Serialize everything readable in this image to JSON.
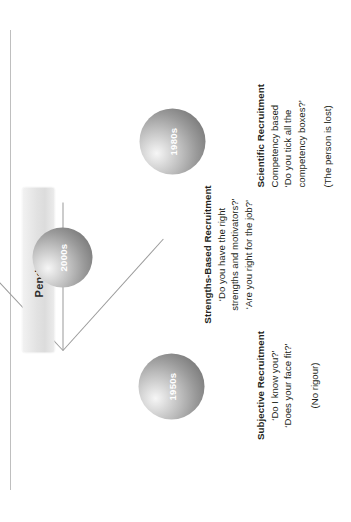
{
  "diagram": {
    "title": "Pendulum",
    "pivot_label": "Pendulum",
    "nodes": [
      {
        "era": "1950s",
        "heading": "Subjective Recruitment",
        "lines": [
          "‘Do I know you?’",
          "‘Does your face fit?’"
        ],
        "note": "(No rigour)"
      },
      {
        "era": "2000s",
        "heading": "Strengths-Based Recruitment",
        "lines": [
          "‘Do you have the right",
          "strengths and motivators?’",
          "‘Are you right for the job?’"
        ],
        "note": ""
      },
      {
        "era": "1980s",
        "heading": "Scientific Recruitment",
        "lines": [
          "Competency based",
          "‘Do you tick all the",
          "competency boxes?’"
        ],
        "note": "(The person is lost)"
      }
    ],
    "colors": {
      "sphere_light": "#f6f6f6",
      "sphere_dark": "#6e6e6e",
      "bar_fill": "#e2e2e2",
      "arm": "#9a9a9a",
      "text": "#231f20",
      "rule": "#bfbfbf"
    }
  }
}
